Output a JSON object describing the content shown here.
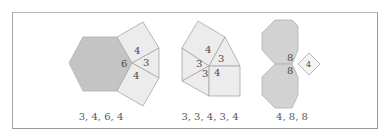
{
  "colors": {
    "dark_fill": "#c4c4c4",
    "light_fill": "#ececec",
    "medium_fill": "#d2d2d2",
    "stroke": "#a6a6a6",
    "frame_border": "#9a9a9a",
    "text": "#4a4a4a"
  },
  "figures": [
    {
      "name": "vertex-config-3-4-6-4",
      "caption": "3, 4, 6, 4",
      "labels": {
        "hexagon": "6",
        "square_top": "4",
        "triangle": "3",
        "square_bottom": "4"
      }
    },
    {
      "name": "vertex-config-3-3-4-3-4",
      "caption": "3, 3, 4, 3, 4",
      "labels": {
        "square_top": "4",
        "triangle_right": "3",
        "triangle_left": "3",
        "triangle_bottom": "3",
        "square_bottom": "4"
      }
    },
    {
      "name": "vertex-config-4-8-8",
      "caption": "4, 8, 8",
      "labels": {
        "octagon_top": "8",
        "octagon_bottom": "8",
        "square": "4"
      }
    }
  ]
}
